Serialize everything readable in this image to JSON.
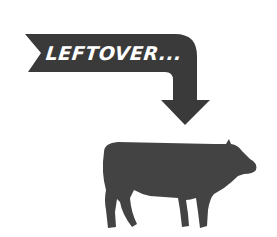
{
  "banner": {
    "text": "LEFTOVER..."
  },
  "colors": {
    "arrow": "#3a3a3a",
    "cow": "#434343",
    "text": "#ffffff",
    "background": "#ffffff"
  },
  "icons": {
    "arrow": "curved-down-arrow-icon",
    "animal": "cow-icon"
  }
}
